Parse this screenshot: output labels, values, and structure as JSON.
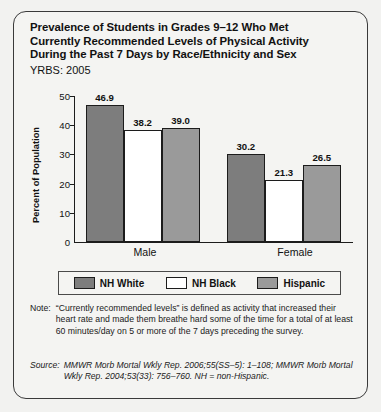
{
  "title": {
    "line1": "Prevalence of Students in Grades 9–12 Who Met",
    "line2": "Currently Recommended Levels of Physical Activity",
    "line3": "During the Past 7 Days by Race/Ethnicity and Sex",
    "subtitle": "YRBS: 2005"
  },
  "chart_data": {
    "type": "bar",
    "title": "Prevalence of Students in Grades 9–12 Who Met Currently Recommended Levels of Physical Activity During the Past 7 Days by Race/Ethnicity and Sex",
    "subtitle": "YRBS: 2005",
    "xlabel": "",
    "ylabel": "Percent of Population",
    "ylim": [
      0,
      50
    ],
    "yticks": [
      0,
      10,
      20,
      30,
      40,
      50
    ],
    "ytick_labels": [
      "0",
      "10",
      "20",
      "30",
      "40",
      "50"
    ],
    "grid": false,
    "legend_position": "bottom",
    "categories": [
      "Male",
      "Female"
    ],
    "series": [
      {
        "name": "NH White",
        "color": "#7d7d7d",
        "values": [
          46.9,
          30.2
        ],
        "value_labels": [
          "46.9",
          "30.2"
        ]
      },
      {
        "name": "NH Black",
        "color": "#ffffff",
        "values": [
          38.2,
          21.3
        ],
        "value_labels": [
          "38.2",
          "21.3"
        ]
      },
      {
        "name": "Hispanic",
        "color": "#9a9a9a",
        "values": [
          39.0,
          26.5
        ],
        "value_labels": [
          "39.0",
          "26.5"
        ]
      }
    ]
  },
  "legend": [
    {
      "label": "NH White",
      "swatch": "dark"
    },
    {
      "label": "NH Black",
      "swatch": "white"
    },
    {
      "label": "Hispanic",
      "swatch": "medium"
    }
  ],
  "note": {
    "key": "Note:",
    "body": "“Currently recommended levels” is defined as activity that increased their heart rate and made them breathe hard some of the time for a total of at least 60 minutes/day on 5 or more of the 7 days preceding the survey."
  },
  "source": {
    "key": "Source:",
    "body": "MMWR Morb Mortal Wkly Rep. 2006;55(SS–5): 1–108; MMWR Morb Mortal Wkly Rep. 2004;53(33): 756–760. NH = non-Hispanic."
  }
}
